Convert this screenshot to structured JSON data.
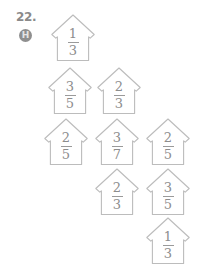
{
  "problem": {
    "number": "22.",
    "icon_label": "H",
    "icon_name": "hint-badge-icon"
  },
  "colors": {
    "outline": "#bcbcbc",
    "text": "#8d8d8d",
    "label": "#8a8a8a",
    "badge_fill": "#8f8f8f",
    "badge_text": "#e4e4e4",
    "background": "#ffffff"
  },
  "houses": [
    {
      "id": "house-1",
      "numerator": "1",
      "denominator": "3",
      "row": 1,
      "col": 1,
      "x": 50,
      "y": 13
    },
    {
      "id": "house-2",
      "numerator": "3",
      "denominator": "5",
      "row": 2,
      "col": 1,
      "x": 47,
      "y": 66
    },
    {
      "id": "house-3",
      "numerator": "2",
      "denominator": "3",
      "row": 2,
      "col": 2,
      "x": 96,
      "y": 66
    },
    {
      "id": "house-4",
      "numerator": "2",
      "denominator": "5",
      "row": 3,
      "col": 1,
      "x": 43,
      "y": 117
    },
    {
      "id": "house-5",
      "numerator": "3",
      "denominator": "7",
      "row": 3,
      "col": 2,
      "x": 94,
      "y": 117
    },
    {
      "id": "house-6",
      "numerator": "2",
      "denominator": "5",
      "row": 3,
      "col": 3,
      "x": 145,
      "y": 117
    },
    {
      "id": "house-7",
      "numerator": "2",
      "denominator": "3",
      "row": 4,
      "col": 2,
      "x": 94,
      "y": 167
    },
    {
      "id": "house-8",
      "numerator": "3",
      "denominator": "5",
      "row": 4,
      "col": 3,
      "x": 145,
      "y": 167
    },
    {
      "id": "house-9",
      "numerator": "1",
      "denominator": "3",
      "row": 5,
      "col": 3,
      "x": 145,
      "y": 216
    }
  ]
}
